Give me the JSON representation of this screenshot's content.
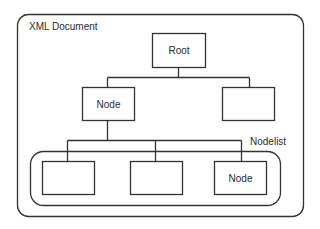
{
  "diagram": {
    "container_label": "XML Document",
    "root_label": "Root",
    "node_label": "Node",
    "right_child_label": "",
    "nodelist_label": "Nodelist",
    "nodelist_items": [
      "",
      "",
      "Node"
    ],
    "colors": {
      "stroke": "#333333",
      "background": "#ffffff",
      "text": "#2b2b2b"
    }
  }
}
